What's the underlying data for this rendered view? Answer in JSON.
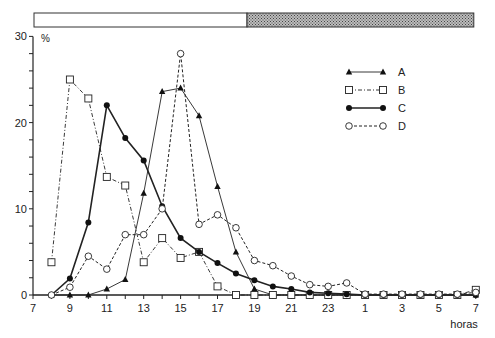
{
  "chart_data": {
    "type": "line",
    "title": "",
    "xlabel": "horas",
    "ylabel": "%",
    "ylim": [
      0,
      30
    ],
    "yticks": [
      0,
      10,
      20,
      30
    ],
    "grid": false,
    "legend_position": "upper-right",
    "x_tick_labels": [
      "7",
      "9",
      "11",
      "13",
      "15",
      "17",
      "19",
      "21",
      "23",
      "1",
      "3",
      "5",
      "7"
    ],
    "x": [
      8,
      9,
      10,
      11,
      12,
      13,
      14,
      15,
      16,
      17,
      18,
      19,
      20,
      21,
      22,
      23,
      24,
      25,
      26,
      27,
      28,
      29,
      30,
      31
    ],
    "light_dark_bar": {
      "light": {
        "from": 7,
        "to": 18.6,
        "label": "day"
      },
      "dark": {
        "from": 18.6,
        "to": 31,
        "label": "night"
      }
    },
    "series": [
      {
        "name": "A",
        "marker": "filled-triangle",
        "line": "solid-thin",
        "values": [
          0,
          0,
          0,
          0.7,
          1.8,
          11.8,
          23.6,
          24,
          20.8,
          12.6,
          5,
          0.7,
          0,
          0,
          0,
          0,
          0,
          0,
          0,
          0,
          0,
          0,
          0,
          0
        ]
      },
      {
        "name": "B",
        "marker": "open-square",
        "line": "dash-dot",
        "values": [
          3.8,
          25,
          22.8,
          13.7,
          12.7,
          3.8,
          6.6,
          4.3,
          5,
          1,
          0,
          0,
          0,
          0,
          0,
          0,
          0,
          0,
          0,
          0,
          0,
          0,
          0,
          0.6
        ]
      },
      {
        "name": "C",
        "marker": "filled-circle",
        "line": "solid-thick",
        "values": [
          0,
          1.9,
          8.4,
          22,
          18.2,
          15.6,
          10.3,
          6.6,
          5,
          3.7,
          2.5,
          1.7,
          1,
          0.7,
          0.3,
          0.2,
          0.1,
          0,
          0,
          0,
          0,
          0,
          0,
          0
        ]
      },
      {
        "name": "D",
        "marker": "open-circle",
        "line": "dashed",
        "values": [
          0,
          0.9,
          4.5,
          3,
          7,
          7,
          10,
          28,
          8.2,
          9.3,
          7.8,
          4,
          3.4,
          2.2,
          1.2,
          1,
          1.4,
          0.1,
          0.1,
          0.1,
          0.1,
          0.1,
          0.1,
          0.3
        ]
      }
    ]
  }
}
